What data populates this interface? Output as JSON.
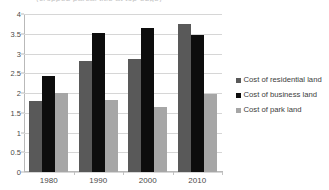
{
  "chart_data": {
    "type": "bar",
    "title": "(cropped partial title at top edge)",
    "subtitle": "",
    "xlabel": "",
    "ylabel": "",
    "categories": [
      "1980",
      "1990",
      "2000",
      "2010"
    ],
    "series": [
      {
        "name": "Cost of residential land",
        "color": "#595959",
        "values": [
          1.8,
          2.82,
          2.85,
          3.75
        ]
      },
      {
        "name": "Cost of business land",
        "color": "#0d0d0d",
        "values": [
          2.42,
          3.52,
          3.65,
          3.47
        ]
      },
      {
        "name": "Cost of park land",
        "color": "#a6a6a6",
        "values": [
          2.0,
          1.83,
          1.65,
          1.97
        ]
      }
    ],
    "ylim": [
      0,
      4
    ],
    "ytick_values": [
      0,
      0.5,
      1,
      1.5,
      2,
      2.5,
      3,
      3.5,
      4
    ],
    "ytick_labels": [
      "0",
      "0.5",
      "1",
      "1.5",
      "2",
      "2.5",
      "3",
      "3.5",
      "4"
    ],
    "grid": true,
    "grid_axis": "y",
    "legend_position": "right",
    "legend_entries": [
      "Cost of residential land",
      "Cost of business land",
      "Cost of park land"
    ]
  }
}
